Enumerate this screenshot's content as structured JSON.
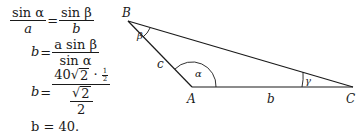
{
  "equations": {
    "eq1": {
      "lhs_num": "sin α",
      "lhs_den": "a",
      "rel": "=",
      "rhs_num": "sin β",
      "rhs_den": "b"
    },
    "eq2": {
      "lhs": "b",
      "rel": "=",
      "rhs_num": "a sin β",
      "rhs_den": "sin α"
    },
    "eq3": {
      "lhs": "b",
      "rel": "=",
      "num_coef": "40",
      "num_radicand": "2",
      "num_dot": "·",
      "half_num": "1",
      "half_den": "2",
      "den_radicand": "2",
      "den_den": "2"
    },
    "eq4": {
      "text": "b = 40."
    }
  },
  "diagram": {
    "vertices": {
      "A": "A",
      "B": "B",
      "C": "C"
    },
    "sides": {
      "b": "b",
      "c": "c"
    },
    "angles": {
      "alpha": "α",
      "beta": "β",
      "gamma": "γ"
    },
    "line_color": "#1a1a1a"
  }
}
